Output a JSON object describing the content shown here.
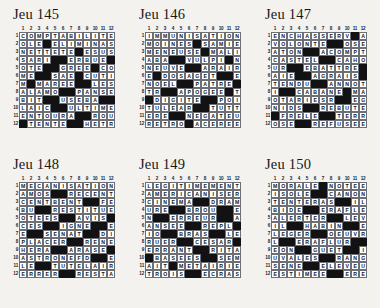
{
  "page": {
    "background_color": "#f3f2ee",
    "grid_cell_color": "#ffffff",
    "block_color": "#121214"
  },
  "column_headers": [
    "1",
    "2",
    "3",
    "4",
    "5",
    "6",
    "7",
    "8",
    "9",
    "10",
    "11",
    "12"
  ],
  "row_numbers": [
    "1",
    "2",
    "3",
    "4",
    "5",
    "6",
    "7",
    "8",
    "9",
    "10",
    "11",
    "12"
  ],
  "puzzles": [
    {
      "title": "Jeu 145",
      "rows": [
        "COMPTABILITE",
        "OLE#ELIMINAS",
        "NETTETE#ESUS",
        "SARI##ERBUE#",
        "OTE##GREE#CO",
        "ME##SAE#CUTI",
        "M#MAREE##LESA",
        "ALAMO##PANSEB",
        "BIT##USEBA##L",
        "LAIC#ULTIMES",
        "ENTOURA##ROUE",
        "#TENTE##HETRE"
      ]
    },
    {
      "title": "Jeu 146",
      "rows": [
        "IMMUNISATION",
        "MOINES#SAMIE",
        "MENEUSE#MALI",
        "ABA##VULPIN#G",
        "NEUVE##ARAIRE",
        "E#DOSAGE##TES",
        "NOEL##PATRES#",
        "TR#APOGEE##TE",
        "#DIGITE##POIL",
        "TULEAR##TUTTI",
        "ERE##NEGATEUR",
        "RETRO#ACEREE"
      ]
    },
    {
      "title": "Jeu 147",
      "rows": [
        "ENCHASSER#VA",
        "VOLONTE##OSER",
        "ATON##ACOMPTE",
        "CASTEL##CAHOT",
        "UR##EBATTRE#E",
        "AIE##AGRAISE#",
        "TENDU##ANNOTE",
        "I##CABANE#MAT",
        "OTARIES##REGI",
        "NIDS#REBUTER",
        "#FRELE##TERRE",
        "OSE#REFUSEES"
      ]
    },
    {
      "title": "Jeu 148",
      "rows": [
        "MECANISATION",
        "AMOS##RECENTE",
        "CENTBENT##FEU",
        "BU##RESTITUER",
        "OTEES##AVIS#O",
        "CES##IGNEE##SN",
        "E##SENAT##DITE",
        "PLACER##RENES",
        "HERA##ARASER#",
        "ASTRONEF##DES",
        "LE##TUTELAIRE",
        "ERRER##RESTAT"
      ]
    },
    {
      "title": "Jeu 149",
      "rows": [
        "LEGITIMEMENT",
        "AMERICANISER",
        "CINEMA##DRAME",
        "URE##BROUE##EM",
        "N##ERREUR##ASA",
        "ANSEE##REPLI#",
        "IO##BRAS##LESA",
        "RUER##CESAR#L",
        "ERRANT##RITAL",
        "#BASEES##SEMI",
        "AIT#METAIRIE",
        "TROIS##ECRASE"
      ]
    },
    {
      "title": "Jeu 150",
      "rows": [
        "MORALE#NOTEE",
        "ISOLE##CANONS",
        "TENTERAS##ILE",
        "BIDE##ERAFLER",
        "ALERTER##LEVI",
        "IL##HABINE##EN",
        "LEGER##OEUVRE",
        "L##ERAFLURE##S",
        "EON##GUET##II",
        "UVALES##RANGE",
        "SENE##ELEVEUR",
        "ESTIMEE##ERES"
      ]
    }
  ],
  "blocks": [
    [
      [
        2,
        4
      ],
      [
        3,
        8
      ],
      [
        4,
        5
      ],
      [
        4,
        6
      ],
      [
        4,
        12
      ],
      [
        5,
        4
      ],
      [
        5,
        5
      ],
      [
        5,
        10
      ],
      [
        6,
        3
      ],
      [
        6,
        4
      ],
      [
        6,
        8
      ],
      [
        7,
        2
      ],
      [
        7,
        8
      ],
      [
        7,
        9
      ],
      [
        8,
        6
      ],
      [
        8,
        7
      ],
      [
        9,
        4
      ],
      [
        9,
        5
      ],
      [
        9,
        11
      ],
      [
        9,
        12
      ],
      [
        10,
        5
      ],
      [
        10,
        6
      ],
      [
        11,
        8
      ],
      [
        11,
        9
      ],
      [
        12,
        1
      ],
      [
        12,
        7
      ],
      [
        12,
        8
      ]
    ],
    [
      [
        2,
        7
      ],
      [
        3,
        8
      ],
      [
        4,
        4
      ],
      [
        4,
        5
      ],
      [
        4,
        11
      ],
      [
        5,
        6
      ],
      [
        5,
        7
      ],
      [
        6,
        2
      ],
      [
        6,
        10
      ],
      [
        6,
        11
      ],
      [
        7,
        5
      ],
      [
        7,
        6
      ],
      [
        7,
        12
      ],
      [
        8,
        3
      ],
      [
        8,
        4
      ],
      [
        8,
        11
      ],
      [
        9,
        1
      ],
      [
        9,
        8
      ],
      [
        9,
        9
      ],
      [
        10,
        7
      ],
      [
        10,
        8
      ],
      [
        11,
        4
      ],
      [
        11,
        5
      ],
      [
        12,
        6
      ]
    ],
    [
      [
        1,
        11
      ],
      [
        2,
        8
      ],
      [
        2,
        9
      ],
      [
        3,
        5
      ],
      [
        3,
        6
      ],
      [
        4,
        7
      ],
      [
        4,
        8
      ],
      [
        5,
        3
      ],
      [
        5,
        4
      ],
      [
        5,
        12
      ],
      [
        6,
        4
      ],
      [
        6,
        5
      ],
      [
        6,
        12
      ],
      [
        7,
        6
      ],
      [
        7,
        7
      ],
      [
        8,
        2
      ],
      [
        8,
        3
      ],
      [
        8,
        10
      ],
      [
        9,
        9
      ],
      [
        9,
        10
      ],
      [
        10,
        5
      ],
      [
        10,
        6
      ],
      [
        11,
        1
      ],
      [
        11,
        7
      ],
      [
        11,
        8
      ],
      [
        12,
        4
      ],
      [
        12,
        5
      ]
    ],
    [
      [
        2,
        5
      ],
      [
        2,
        6
      ],
      [
        3,
        9
      ],
      [
        3,
        10
      ],
      [
        4,
        3
      ],
      [
        4,
        4
      ],
      [
        5,
        6
      ],
      [
        5,
        7
      ],
      [
        5,
        12
      ],
      [
        6,
        4
      ],
      [
        6,
        5
      ],
      [
        6,
        10
      ],
      [
        6,
        11
      ],
      [
        7,
        2
      ],
      [
        7,
        3
      ],
      [
        7,
        9
      ],
      [
        7,
        10
      ],
      [
        8,
        7
      ],
      [
        8,
        8
      ],
      [
        9,
        5
      ],
      [
        9,
        6
      ],
      [
        9,
        12
      ],
      [
        10,
        10
      ],
      [
        10,
        11
      ],
      [
        11,
        3
      ],
      [
        11,
        4
      ],
      [
        12,
        6
      ],
      [
        12,
        7
      ]
    ],
    [
      [
        3,
        7
      ],
      [
        3,
        8
      ],
      [
        4,
        4
      ],
      [
        4,
        5
      ],
      [
        4,
        10
      ],
      [
        4,
        11
      ],
      [
        5,
        2
      ],
      [
        5,
        3
      ],
      [
        5,
        10
      ],
      [
        5,
        11
      ],
      [
        6,
        6
      ],
      [
        6,
        7
      ],
      [
        6,
        12
      ],
      [
        7,
        3
      ],
      [
        7,
        4
      ],
      [
        7,
        9
      ],
      [
        7,
        10
      ],
      [
        8,
        5
      ],
      [
        8,
        6
      ],
      [
        8,
        12
      ],
      [
        9,
        7
      ],
      [
        9,
        8
      ],
      [
        10,
        1
      ],
      [
        10,
        8
      ],
      [
        10,
        9
      ],
      [
        11,
        4
      ],
      [
        12,
        6
      ],
      [
        12,
        7
      ]
    ],
    [
      [
        1,
        7
      ],
      [
        2,
        6
      ],
      [
        2,
        7
      ],
      [
        3,
        9
      ],
      [
        3,
        10
      ],
      [
        4,
        5
      ],
      [
        4,
        6
      ],
      [
        5,
        8
      ],
      [
        5,
        9
      ],
      [
        6,
        3
      ],
      [
        6,
        4
      ],
      [
        6,
        10
      ],
      [
        6,
        11
      ],
      [
        7,
        6
      ],
      [
        7,
        7
      ],
      [
        8,
        2
      ],
      [
        8,
        3
      ],
      [
        8,
        11
      ],
      [
        8,
        12
      ],
      [
        9,
        4
      ],
      [
        9,
        5
      ],
      [
        9,
        10
      ],
      [
        9,
        11
      ],
      [
        10,
        7
      ],
      [
        10,
        8
      ],
      [
        11,
        5
      ],
      [
        11,
        6
      ],
      [
        12,
        8
      ],
      [
        12,
        9
      ]
    ]
  ]
}
